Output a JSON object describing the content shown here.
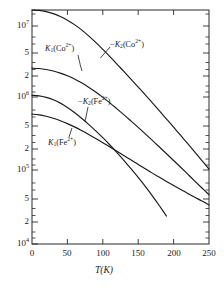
{
  "figure": {
    "background": "#ffffff",
    "ink_color": "#1a1a1a"
  },
  "chart_data": {
    "type": "line",
    "title": "",
    "xlabel": "T(K)",
    "ylabel": "",
    "xlim": [
      0,
      250
    ],
    "ylim": [
      10000,
      30000000
    ],
    "yscale": "log",
    "xscale": "linear",
    "grid": false,
    "legend": "inline-annotations",
    "xticks": [
      0,
      50,
      100,
      150,
      200,
      250
    ],
    "xtick_labels": [
      "0",
      "50",
      "100",
      "150",
      "200",
      "250"
    ],
    "yticks": [
      10000000,
      5000000,
      2000000,
      1000000,
      500000,
      200000,
      100000,
      50000,
      20000,
      10000
    ],
    "ytick_labels": [
      "10⁷",
      "5",
      "2",
      "10⁶",
      "5",
      "2",
      "10⁵",
      "5",
      "2",
      "10⁴"
    ],
    "series": [
      {
        "name": "-K2(Co2+)",
        "label_plain": "-K2(Co2+)",
        "x": [
          0,
          10,
          20,
          30,
          40,
          50,
          60,
          70,
          80,
          90,
          100,
          110,
          120,
          130,
          140,
          150,
          160,
          170,
          180,
          190,
          200,
          210,
          220,
          230,
          240,
          250
        ],
        "y": [
          30000000,
          29600000,
          28400000,
          26500000,
          24000000,
          21200000,
          18200000,
          15200000,
          12400000,
          9900000,
          7800000,
          6100000,
          4700000,
          3650000,
          2800000,
          2150000,
          1650000,
          1250000,
          950000,
          720000,
          545000,
          410000,
          310000,
          232000,
          174000,
          130000
        ]
      },
      {
        "name": "K1(Co2+)",
        "label_plain": "K1(Co2+)",
        "x": [
          0,
          10,
          20,
          30,
          40,
          50,
          60,
          70,
          80,
          90,
          100,
          110,
          120,
          130,
          140,
          150,
          160,
          170,
          180,
          190,
          200,
          210,
          220,
          230,
          240,
          250
        ],
        "y": [
          4100000,
          4050000,
          3920000,
          3720000,
          3460000,
          3160000,
          2830000,
          2480000,
          2140000,
          1810000,
          1510000,
          1250000,
          1020000,
          830000,
          670000,
          540000,
          433000,
          346000,
          276000,
          219000,
          174000,
          138000,
          109000,
          86000,
          68000,
          54000
        ]
      },
      {
        "name": "-K2(Fe2+)",
        "label_plain": "-K2(Fe2+)",
        "x": [
          0,
          10,
          20,
          30,
          40,
          50,
          60,
          70,
          80,
          90,
          100,
          110,
          120,
          130,
          140,
          150,
          160,
          170,
          180,
          190
        ],
        "y": [
          1620000,
          1590000,
          1510000,
          1390000,
          1240000,
          1070000,
          900000,
          740000,
          600000,
          480000,
          380000,
          296000,
          228000,
          174000,
          131000,
          98000,
          72000,
          52000,
          37000,
          26000
        ]
      },
      {
        "name": "K1(Fe2+)",
        "label_plain": "K1(Fe2+)",
        "x": [
          0,
          10,
          20,
          30,
          40,
          50,
          60,
          70,
          80,
          90,
          100,
          110,
          120,
          130,
          140,
          150,
          160,
          170,
          180,
          190,
          200,
          210,
          220,
          230,
          240,
          250
        ],
        "y": [
          850000,
          830000,
          790000,
          740000,
          680000,
          615000,
          550000,
          485000,
          425000,
          370000,
          320000,
          276000,
          238000,
          205000,
          177000,
          152000,
          131000,
          113000,
          98000,
          85000,
          74000,
          64500,
          56500,
          49500,
          43500,
          38000
        ]
      }
    ],
    "annotations": [
      {
        "id": "k1-co",
        "html": "<i>K</i><sub>1</sub>(Co<sup>2+</sup>)"
      },
      {
        "id": "mk2-co",
        "html": "−<i>K</i><sub>2</sub>(Co<sup>2+</sup>)"
      },
      {
        "id": "mk2-fe",
        "html": "−<i>K</i><sub>2</sub>(Fe<sup>2+</sup>)"
      },
      {
        "id": "k1-fe",
        "html": "<i>K</i><sub>1</sub>(Fe<sup>2+</sup>)"
      }
    ]
  },
  "axes": {
    "x_title_html": "<i>T</i>(K)",
    "x_title_plain": "T(K)",
    "ytick_labels": {
      "t7": "10",
      "t7sup": "7",
      "t7_5": "5",
      "t7_2": "2",
      "t6": "10",
      "t6sup": "6",
      "t6_5": "5",
      "t6_2": "2",
      "t5": "10",
      "t5sup": "5",
      "t5_5": "5",
      "t5_2": "2",
      "t4": "10",
      "t4sup": "4"
    },
    "xtick_labels": {
      "x0": "0",
      "x50": "50",
      "x100": "100",
      "x150": "150",
      "x200": "200",
      "x250": "250"
    }
  },
  "curve_labels": {
    "k1_co": {
      "k": "K",
      "sub": "1",
      "open": "(Co",
      "sup": "2+",
      "close": ")"
    },
    "mk2_co": {
      "minus": "−",
      "k": "K",
      "sub": "2",
      "open": "(Co",
      "sup": "2+",
      "close": ")"
    },
    "mk2_fe": {
      "minus": "−",
      "k": "K",
      "sub": "2",
      "open": "(Fe",
      "sup": "2+",
      "close": ")"
    },
    "k1_fe": {
      "k": "K",
      "sub": "1",
      "open": "(Fe",
      "sup": "2+",
      "close": ")"
    }
  }
}
